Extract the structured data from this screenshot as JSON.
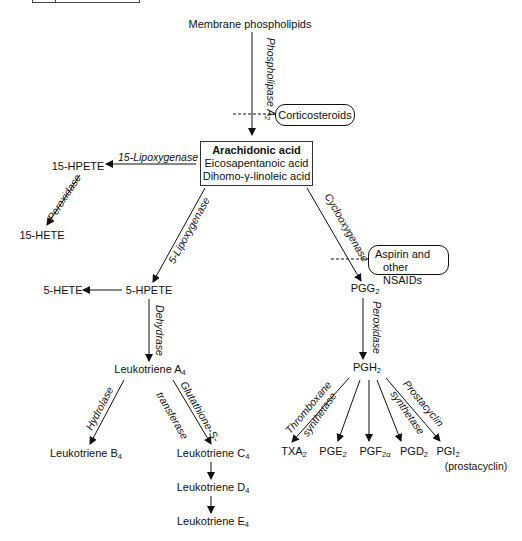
{
  "diagram": {
    "source": {
      "label": "Membrane phospholipids"
    },
    "precursor_box": {
      "title": "Arachidonic acid",
      "lines": [
        "Eicosapentanoic acid",
        "Dihomo-γ-linoleic acid"
      ]
    },
    "inhibitors": {
      "corticosteroids": "Corticosteroids",
      "nsaids_line1": "Aspirin and",
      "nsaids_line2": "other NSAIDs"
    },
    "enzymes": {
      "phospholipase": "Phospholipase A",
      "phospholipase_sub": "2",
      "lipoxygenase15": "15-Lipoxygenase",
      "peroxidase_left": "Peroxidase",
      "lipoxygenase5": "5-Lipoxygenase",
      "dehydrase": "Dehydrase",
      "hydrolase": "Hydrolase",
      "glutathione1": "Glutathione-S-",
      "glutathione2": "transferase",
      "cyclooxygenase": "Cyclooxygenase",
      "peroxidase_right": "Peroxidase",
      "thromboxane1": "Thromboxane",
      "thromboxane2": "synthetase",
      "prostacyclin1": "Prostacyclin",
      "prostacyclin2": "synthetase"
    },
    "products": {
      "hpete15": "15-HPETE",
      "hete15": "15-HETE",
      "hpete5": "5-HPETE",
      "hete5": "5-HETE",
      "lta": "Leukotriene A",
      "lta_sub": "4",
      "ltb": "Leukotriene B",
      "ltb_sub": "4",
      "ltc": "Leukotriene C",
      "ltc_sub": "4",
      "ltd": "Leukotriene D",
      "ltd_sub": "4",
      "lte": "Leukotriene E",
      "lte_sub": "4",
      "pgg": "PGG",
      "pgg_sub": "2",
      "pgh": "PGH",
      "pgh_sub": "2",
      "txa": "TXA",
      "txa_sub": "2",
      "pge": "PGE",
      "pge_sub": "2",
      "pgf": "PGF",
      "pgf_sub": "2α",
      "pgd": "PGD",
      "pgd_sub": "2",
      "pgi": "PGI",
      "pgi_sub": "2",
      "pgi_note": "(prostacyclin)"
    },
    "colors": {
      "line": "#111111",
      "background": "#ffffff"
    }
  }
}
